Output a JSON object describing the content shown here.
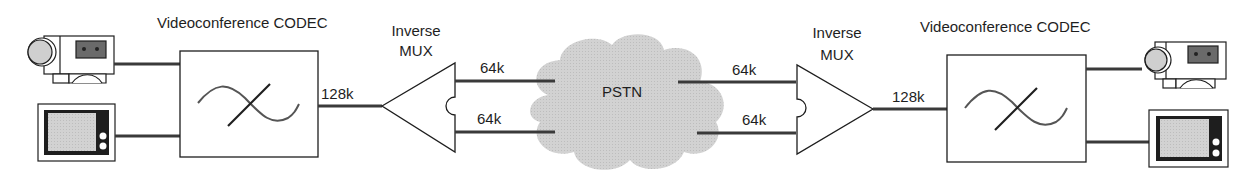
{
  "left_site": {
    "codec_label": "Videoconference CODEC",
    "mux_label_line1": "Inverse",
    "mux_label_line2": "MUX",
    "link_rate": "128k",
    "channel_top_rate": "64k",
    "channel_bottom_rate": "64k",
    "devices": [
      "camera-icon",
      "monitor-icon"
    ]
  },
  "network": {
    "label": "PSTN",
    "icon": "cloud-icon"
  },
  "right_site": {
    "codec_label": "Videoconference CODEC",
    "mux_label_line1": "Inverse",
    "mux_label_line2": "MUX",
    "link_rate": "128k",
    "channel_top_rate": "64k",
    "channel_bottom_rate": "64k",
    "devices": [
      "camera-icon",
      "monitor-icon"
    ]
  },
  "colors": {
    "line": "#3a3a3a",
    "stroke": "#1e1e1e",
    "cloud_fill": "#cfcfcf",
    "screen_fill": "#d6d6d6",
    "wave": "#555555"
  }
}
